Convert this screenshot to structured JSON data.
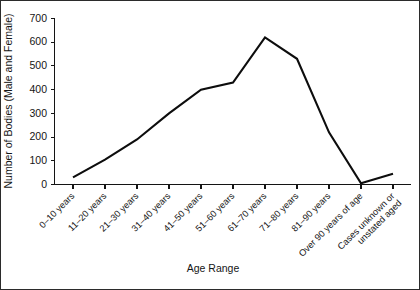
{
  "chart_data": {
    "type": "line",
    "title": "",
    "xlabel": "Age Range",
    "ylabel": "Number of Bodies (Male and Female)",
    "categories": [
      "0–10 years",
      "11–20 years",
      "21–30 years",
      "31–40 years",
      "41–50 years",
      "51–60 years",
      "61–70 years",
      "71–80 years",
      "81–90 years",
      "Over 90 years of age",
      "Cases unknown or unstated aged"
    ],
    "category_lines": [
      [
        "0–10 years"
      ],
      [
        "11–20 years"
      ],
      [
        "21–30 years"
      ],
      [
        "31–40 years"
      ],
      [
        "41–50 years"
      ],
      [
        "51–60 years"
      ],
      [
        "61–70 years"
      ],
      [
        "71–80 years"
      ],
      [
        "81–90 years"
      ],
      [
        "Over 90 years of age"
      ],
      [
        "Cases unknown or",
        "unstated aged"
      ]
    ],
    "values": [
      30,
      105,
      190,
      300,
      400,
      430,
      620,
      530,
      220,
      5,
      45
    ],
    "ylim": [
      0,
      700
    ],
    "yticks": [
      0,
      100,
      200,
      300,
      400,
      500,
      600,
      700
    ],
    "ytick_labels": [
      "0",
      "100",
      "200",
      "300",
      "400",
      "500",
      "600",
      "700"
    ],
    "grid": false,
    "legend": "none",
    "line_color": "#0d0d0d"
  },
  "axes": {
    "x_title": "Age Range",
    "y_title": "Number of Bodies (Male and Female)"
  }
}
